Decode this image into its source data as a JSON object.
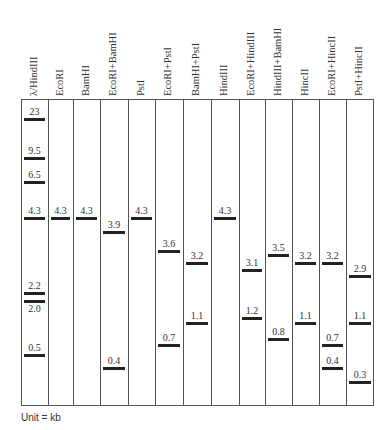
{
  "chart_data": {
    "type": "gel_electrophoresis",
    "title": "",
    "unit_label": "Unit = kb",
    "lanes": [
      {
        "name": "λ/HindIII",
        "bands": [
          23,
          9.5,
          6.5,
          4.3,
          2.2,
          2.0,
          0.5
        ]
      },
      {
        "name": "EcoRI",
        "bands": [
          4.3
        ]
      },
      {
        "name": "BamHI",
        "bands": [
          4.3
        ]
      },
      {
        "name": "EcoRI+BamHI",
        "bands": [
          3.9,
          0.4
        ]
      },
      {
        "name": "PstI",
        "bands": [
          4.3
        ]
      },
      {
        "name": "EcoRI+PstI",
        "bands": [
          3.6,
          0.7
        ]
      },
      {
        "name": "BamHI+PstI",
        "bands": [
          3.2,
          1.1
        ]
      },
      {
        "name": "HindIII",
        "bands": [
          4.3
        ]
      },
      {
        "name": "EcoRI+HindIII",
        "bands": [
          3.1,
          1.2
        ]
      },
      {
        "name": "HindIII+BamHI",
        "bands": [
          3.5,
          0.8
        ]
      },
      {
        "name": "HincII",
        "bands": [
          3.2,
          1.1
        ]
      },
      {
        "name": "EcoRI+HincII",
        "bands": [
          3.2,
          0.7,
          0.4
        ]
      },
      {
        "name": "PstI+HincII",
        "bands": [
          2.9,
          1.1,
          0.3
        ]
      }
    ]
  },
  "layout": {
    "col_edges": [
      21,
      48,
      73,
      100,
      128,
      155,
      183,
      211,
      239,
      265,
      292,
      319,
      346,
      374
    ],
    "band_y": {
      "23": 118,
      "9.5": 157,
      "6.5": 181,
      "4.3": 217,
      "3.9": 231,
      "3.6": 250,
      "3.5": 254,
      "3.2": 262,
      "3.1": 269,
      "2.9": 275,
      "2.2": 292,
      "2.0": 300,
      "1.2": 317,
      "1.1": 322,
      "0.8": 338,
      "0.7": 344,
      "0.5": 354,
      "0.4": 367,
      "0.3": 381
    },
    "label_below": [
      "2.0"
    ]
  },
  "footer": {
    "unit": "Unit = kb"
  }
}
